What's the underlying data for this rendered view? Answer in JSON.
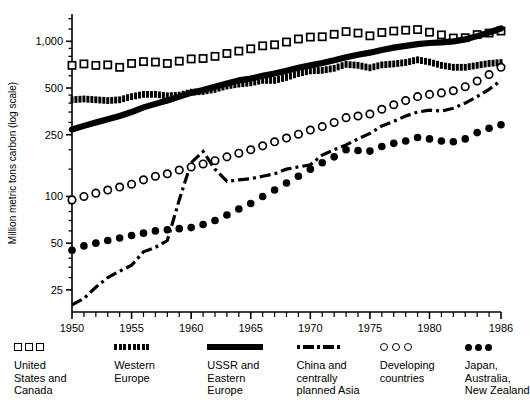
{
  "chart_data": {
    "type": "line",
    "title": "",
    "xlabel": "",
    "ylabel": "Million metric tons carbon (log scale)",
    "scale": "log",
    "grid": false,
    "legend_position": "bottom",
    "xlim": [
      1950,
      1986
    ],
    "ylim": [
      18,
      1500
    ],
    "x_ticks": [
      1950,
      1955,
      1960,
      1965,
      1970,
      1975,
      1980,
      1986
    ],
    "x_tick_labels": [
      "1950",
      "1955",
      "1960",
      "1965",
      "1970",
      "1975",
      "1980",
      "1986"
    ],
    "x_minor_tick_interval": 1,
    "y_ticks": [
      25,
      50,
      100,
      250,
      500,
      1000
    ],
    "y_tick_labels": [
      "25",
      "50",
      "100",
      "250",
      "500",
      "1,000"
    ],
    "x": [
      1950,
      1951,
      1952,
      1953,
      1954,
      1955,
      1956,
      1957,
      1958,
      1959,
      1960,
      1961,
      1962,
      1963,
      1964,
      1965,
      1966,
      1967,
      1968,
      1969,
      1970,
      1971,
      1972,
      1973,
      1974,
      1975,
      1976,
      1977,
      1978,
      1979,
      1980,
      1981,
      1982,
      1983,
      1984,
      1985,
      1986
    ],
    "series": [
      {
        "name": "United States and Canada",
        "marker": "open-square",
        "style": "markers",
        "values": [
          700,
          715,
          700,
          705,
          680,
          720,
          740,
          735,
          720,
          745,
          770,
          775,
          800,
          835,
          865,
          895,
          935,
          950,
          990,
          1035,
          1065,
          1070,
          1110,
          1155,
          1130,
          1085,
          1140,
          1165,
          1180,
          1190,
          1145,
          1100,
          1050,
          1055,
          1105,
          1130,
          1165
        ]
      },
      {
        "name": "Western Europe",
        "marker": "filled-square-dense",
        "style": "markers",
        "values": [
          420,
          425,
          420,
          415,
          420,
          440,
          455,
          455,
          445,
          450,
          470,
          475,
          490,
          515,
          530,
          540,
          560,
          560,
          585,
          620,
          645,
          650,
          670,
          710,
          700,
          675,
          705,
          715,
          730,
          760,
          735,
          700,
          680,
          680,
          700,
          720,
          730
        ]
      },
      {
        "name": "USSR and Eastern Europe",
        "marker": "thick-solid-line",
        "style": "line",
        "values": [
          270,
          285,
          300,
          315,
          330,
          350,
          375,
          395,
          415,
          440,
          465,
          485,
          510,
          535,
          560,
          575,
          600,
          620,
          645,
          675,
          700,
          725,
          755,
          790,
          820,
          845,
          880,
          910,
          935,
          960,
          975,
          985,
          1000,
          1030,
          1080,
          1140,
          1210
        ]
      },
      {
        "name": "China and centrally planned Asia",
        "marker": "dash-dot-line",
        "style": "line",
        "values": [
          20,
          22,
          26,
          30,
          33,
          36,
          44,
          47,
          52,
          95,
          165,
          195,
          150,
          125,
          128,
          130,
          135,
          140,
          150,
          155,
          160,
          185,
          200,
          215,
          235,
          255,
          285,
          305,
          330,
          350,
          360,
          355,
          370,
          400,
          440,
          490,
          560
        ]
      },
      {
        "name": "Developing countries",
        "marker": "open-circle",
        "style": "markers",
        "values": [
          95,
          100,
          105,
          110,
          115,
          120,
          128,
          135,
          140,
          148,
          155,
          162,
          170,
          180,
          190,
          200,
          212,
          225,
          238,
          252,
          268,
          282,
          300,
          322,
          330,
          340,
          365,
          390,
          415,
          440,
          455,
          465,
          480,
          510,
          555,
          610,
          680
        ]
      },
      {
        "name": "Japan, Australia, New Zealand",
        "marker": "filled-circle",
        "style": "markers",
        "values": [
          45,
          48,
          50,
          52,
          54,
          56,
          58,
          60,
          61,
          62,
          63,
          66,
          70,
          76,
          83,
          90,
          100,
          110,
          122,
          135,
          150,
          165,
          180,
          200,
          198,
          196,
          210,
          220,
          228,
          240,
          235,
          228,
          225,
          235,
          258,
          275,
          290
        ]
      }
    ]
  }
}
